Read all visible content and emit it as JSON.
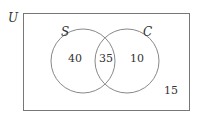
{
  "diagram": {
    "type": "venn",
    "universe_label": "U",
    "sets": [
      {
        "name": "S",
        "only_count": "40"
      },
      {
        "name": "C",
        "only_count": "10"
      }
    ],
    "intersection_count": "35",
    "outside_count": "15"
  }
}
